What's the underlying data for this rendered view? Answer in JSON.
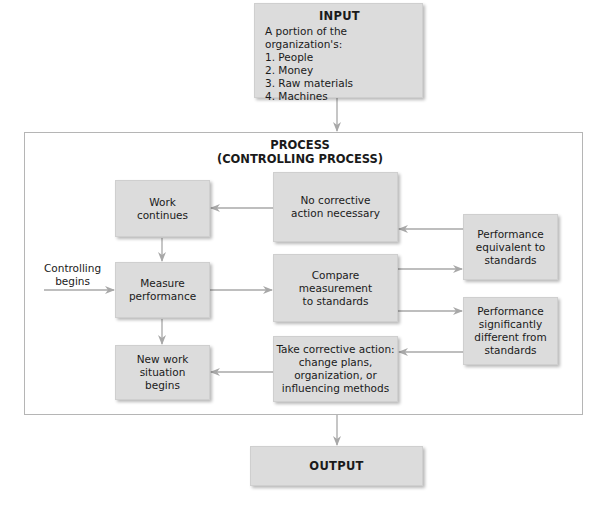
{
  "input": {
    "title": "INPUT",
    "intro": "A portion of the organization's:",
    "items": [
      "1. People",
      "2. Money",
      "3. Raw materials",
      "4. Machines"
    ]
  },
  "process": {
    "title_line1": "PROCESS",
    "title_line2": "(CONTROLLING PROCESS)",
    "start_label_line1": "Controlling",
    "start_label_line2": "begins",
    "boxes": {
      "work_continues": [
        "Work",
        "continues"
      ],
      "measure_performance": [
        "Measure",
        "performance"
      ],
      "new_work_situation": [
        "New work",
        "situation",
        "begins"
      ],
      "no_corrective_action": [
        "No corrective",
        "action necessary"
      ],
      "compare": [
        "Compare",
        "measurement",
        "to standards"
      ],
      "take_corrective_action": [
        "Take corrective action:",
        "change plans,",
        "organization, or",
        "influencing methods"
      ],
      "performance_equivalent": [
        "Performance",
        "equivalent to",
        "standards"
      ],
      "performance_different": [
        "Performance",
        "significantly",
        "different from",
        "standards"
      ]
    }
  },
  "output": {
    "title": "OUTPUT"
  },
  "colors": {
    "box_fill": "#dcdcdc",
    "arrow": "#a8a8a8",
    "frame": "#b5b5b5"
  }
}
